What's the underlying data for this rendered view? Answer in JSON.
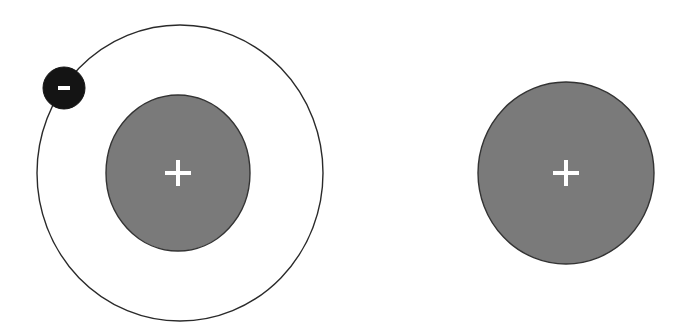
{
  "diagram": {
    "colors": {
      "background": "#ffffff",
      "orbit_stroke": "#2a2a2a",
      "nucleus_fill": "#7a7a7a",
      "nucleus_stroke": "#333333",
      "electron_fill": "#141414",
      "sign_color": "#ffffff"
    },
    "atom": {
      "label": "neutral atom",
      "orbit": {
        "cx": 180,
        "cy": 173,
        "rx": 143,
        "ry": 148
      },
      "nucleus": {
        "cx": 178,
        "cy": 173,
        "rx": 72,
        "ry": 78,
        "sign": "+"
      },
      "electron": {
        "cx": 64,
        "cy": 88,
        "r": 21,
        "sign": "−"
      }
    },
    "ion": {
      "label": "positive ion",
      "nucleus": {
        "cx": 566,
        "cy": 173,
        "rx": 88,
        "ry": 91,
        "sign": "+"
      }
    }
  }
}
